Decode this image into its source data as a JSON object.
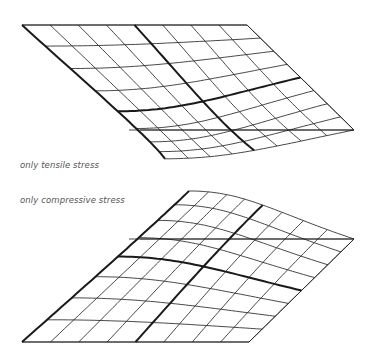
{
  "diagram": {
    "line_color": "#1a1a1a",
    "thin_width": 0.8,
    "thick_width": 2.0,
    "grid_divisions": 8,
    "surfaces": [
      {
        "id": "tensile",
        "label": "only tensile stress",
        "kind": "sag",
        "corners": {
          "back_left": [
            22,
            25
          ],
          "back_right": [
            247,
            25
          ],
          "front_right": [
            354,
            130
          ],
          "front_left": [
            129,
            130
          ]
        },
        "depth": 48,
        "reference_line": {
          "y": 130,
          "x1": 140,
          "x2": 354
        },
        "thick_u_lines": [
          4
        ],
        "thick_v_lines": [
          4
        ],
        "thick_edge": "left"
      },
      {
        "id": "compressive",
        "label": "only compressive stress",
        "kind": "dome",
        "corners": {
          "back_left": [
            129,
            239
          ],
          "back_right": [
            354,
            239
          ],
          "front_right": [
            249,
            342
          ],
          "front_left": [
            22,
            342
          ]
        },
        "depth": -48,
        "reference_line": {
          "y": 239,
          "x1": 140,
          "x2": 354
        },
        "thick_u_lines": [
          4
        ],
        "thick_v_lines": [
          4
        ],
        "thick_edge": "left"
      }
    ]
  }
}
